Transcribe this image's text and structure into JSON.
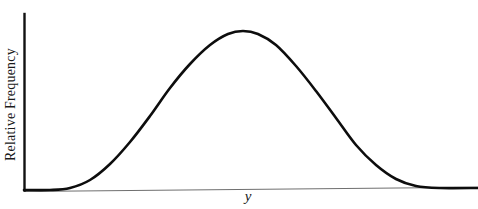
{
  "figure": {
    "background_color": "#ffffff",
    "width": 478,
    "height": 209
  },
  "axes": {
    "y_axis_label": "Relative Frequency",
    "x_axis_label": "y",
    "y_axis_color": "#111111",
    "x_axis_color": "#6f6f6f",
    "origin_x": 24,
    "origin_y": 190,
    "y_axis_top": 14,
    "x_axis_right": 478
  },
  "curve": {
    "color": "#0d0d0d",
    "stroke_width": 2.6,
    "peak_x": 243,
    "peak_y": 31,
    "left_tail_x": 70,
    "right_tail_x": 420
  },
  "chart_data": {
    "type": "line",
    "title": "",
    "subtitle": "",
    "xlabel": "y",
    "ylabel": "Relative Frequency",
    "legend": [],
    "legend_position": "none",
    "grid": false,
    "xlim": [
      0,
      100
    ],
    "ylim": [
      0,
      1
    ],
    "xticks": [],
    "yticks": [],
    "xticklabels": [],
    "yticklabels": [],
    "annotations": [],
    "series": [
      {
        "name": "Relative Frequency",
        "color": "#0d0d0d",
        "x": [
          0,
          4,
          8,
          12,
          16,
          20,
          24,
          28,
          32,
          36,
          40,
          44,
          48,
          52,
          56,
          60,
          64,
          68,
          72,
          76,
          80,
          84,
          88,
          92,
          96,
          100
        ],
        "values": [
          0.0,
          0.0,
          0.001,
          0.003,
          0.008,
          0.018,
          0.038,
          0.073,
          0.128,
          0.206,
          0.31,
          0.435,
          0.57,
          0.7,
          0.81,
          0.898,
          0.958,
          0.991,
          1.0,
          0.985,
          0.945,
          0.88,
          0.795,
          0.69,
          0.575,
          0.46
        ]
      }
    ],
    "curve_points": [
      {
        "x": 24,
        "y": 190
      },
      {
        "x": 50,
        "y": 190
      },
      {
        "x": 70,
        "y": 188
      },
      {
        "x": 90,
        "y": 180
      },
      {
        "x": 110,
        "y": 164
      },
      {
        "x": 130,
        "y": 142
      },
      {
        "x": 150,
        "y": 116
      },
      {
        "x": 170,
        "y": 88
      },
      {
        "x": 190,
        "y": 64
      },
      {
        "x": 210,
        "y": 45
      },
      {
        "x": 228,
        "y": 34
      },
      {
        "x": 243,
        "y": 31
      },
      {
        "x": 258,
        "y": 34
      },
      {
        "x": 276,
        "y": 45
      },
      {
        "x": 296,
        "y": 66
      },
      {
        "x": 316,
        "y": 91
      },
      {
        "x": 336,
        "y": 118
      },
      {
        "x": 356,
        "y": 145
      },
      {
        "x": 376,
        "y": 165
      },
      {
        "x": 396,
        "y": 179
      },
      {
        "x": 416,
        "y": 186
      },
      {
        "x": 440,
        "y": 188
      },
      {
        "x": 478,
        "y": 188
      }
    ]
  }
}
